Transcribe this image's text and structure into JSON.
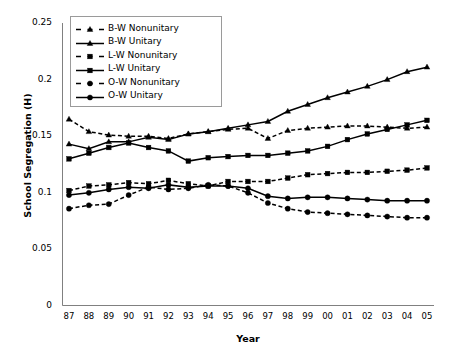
{
  "chart_data": {
    "type": "line",
    "title": "",
    "xlabel": "Year",
    "ylabel": "School Segregation (H)",
    "grid": false,
    "legend_position": "top-left-inside",
    "ylim": [
      0,
      0.25
    ],
    "yticks": [
      "0",
      "0.05",
      "0.1",
      "0.15",
      "0.2",
      "0.25"
    ],
    "ytick_values": [
      0,
      0.05,
      0.1,
      0.15,
      0.2,
      0.25
    ],
    "categories": [
      "87",
      "88",
      "89",
      "90",
      "91",
      "92",
      "93",
      "94",
      "95",
      "96",
      "97",
      "98",
      "99",
      "00",
      "01",
      "02",
      "03",
      "04",
      "05"
    ],
    "series": [
      {
        "name": "B-W Nonunitary",
        "marker": "triangle",
        "line": "dashed",
        "color": "#000000",
        "values": [
          0.165,
          0.154,
          0.151,
          0.15,
          0.15,
          0.148,
          0.152,
          0.154,
          0.156,
          0.157,
          0.148,
          0.155,
          0.157,
          0.158,
          0.159,
          0.159,
          0.158,
          0.157,
          0.158
        ]
      },
      {
        "name": "B-W Unitary",
        "marker": "triangle",
        "line": "solid",
        "color": "#000000",
        "values": [
          0.143,
          0.139,
          0.145,
          0.145,
          0.149,
          0.147,
          0.152,
          0.154,
          0.157,
          0.16,
          0.163,
          0.172,
          0.178,
          0.184,
          0.189,
          0.194,
          0.2,
          0.207,
          0.211
        ]
      },
      {
        "name": "L-W Nonunitary",
        "marker": "square",
        "line": "dashed",
        "color": "#000000",
        "values": [
          0.102,
          0.106,
          0.107,
          0.109,
          0.108,
          0.111,
          0.108,
          0.106,
          0.11,
          0.11,
          0.11,
          0.113,
          0.116,
          0.117,
          0.118,
          0.118,
          0.119,
          0.12,
          0.122
        ]
      },
      {
        "name": "L-W Unitary",
        "marker": "square",
        "line": "solid",
        "color": "#000000",
        "values": [
          0.13,
          0.135,
          0.14,
          0.144,
          0.14,
          0.137,
          0.128,
          0.131,
          0.132,
          0.133,
          0.133,
          0.135,
          0.137,
          0.141,
          0.147,
          0.152,
          0.156,
          0.16,
          0.164
        ]
      },
      {
        "name": "O-W Nonunitary",
        "marker": "circle",
        "line": "dashed",
        "color": "#000000",
        "values": [
          0.086,
          0.089,
          0.09,
          0.098,
          0.105,
          0.103,
          0.104,
          0.107,
          0.106,
          0.1,
          0.091,
          0.086,
          0.083,
          0.082,
          0.081,
          0.08,
          0.079,
          0.078,
          0.078
        ]
      },
      {
        "name": "O-W Unitary",
        "marker": "circle",
        "line": "solid",
        "color": "#000000",
        "values": [
          0.098,
          0.1,
          0.103,
          0.105,
          0.104,
          0.107,
          0.105,
          0.106,
          0.106,
          0.104,
          0.097,
          0.095,
          0.096,
          0.096,
          0.095,
          0.094,
          0.093,
          0.093,
          0.093
        ]
      }
    ]
  },
  "axis": {
    "x_label": "Year",
    "y_label": "School Segregation (H)"
  },
  "legend": {
    "items": [
      {
        "label": "B-W Nonunitary"
      },
      {
        "label": "B-W Unitary"
      },
      {
        "label": "L-W Nonunitary"
      },
      {
        "label": "L-W Unitary"
      },
      {
        "label": "O-W Nonunitary"
      },
      {
        "label": "O-W Unitary"
      }
    ]
  }
}
